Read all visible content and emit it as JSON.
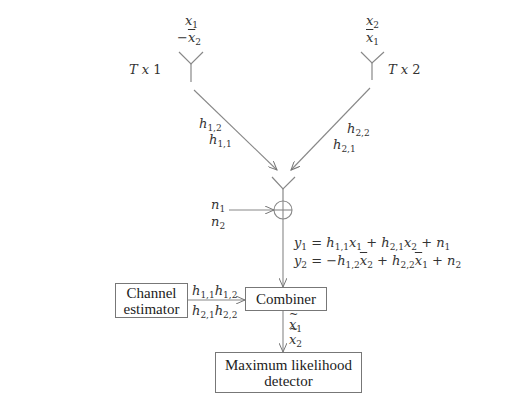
{
  "diagram": {
    "type": "Alamouti space-time block code system",
    "transmitters": [
      {
        "label": "Tx 1",
        "symbol_t1": "x1",
        "symbol_t2": "-x̄2"
      },
      {
        "label": "Tx 2",
        "symbol_t1": "x2",
        "symbol_t2": "x̄1"
      }
    ],
    "channels": {
      "left": [
        "h1,2",
        "h1,1"
      ],
      "right": [
        "h2,2",
        "h2,1"
      ]
    },
    "noise": [
      "n1",
      "n2"
    ],
    "received_equations": [
      "y1 = h1,1 x1 + h2,1 x2 + n1",
      "y2 = −h1,2 x̄2 + h2,2 x̄1 + n2"
    ],
    "blocks": {
      "channel_estimator": [
        "Channel",
        "estimator"
      ],
      "combiner": "Combiner",
      "ml_detector": [
        "Maximum likelihood",
        "detector"
      ]
    },
    "estimator_outputs": [
      "h1,1 h1,2",
      "h2,1 h2,2"
    ],
    "combiner_outputs": [
      "x̃1",
      "x̃2"
    ],
    "colors": {
      "line": "#888888",
      "text": "#333333",
      "box_border": "#777777"
    }
  }
}
